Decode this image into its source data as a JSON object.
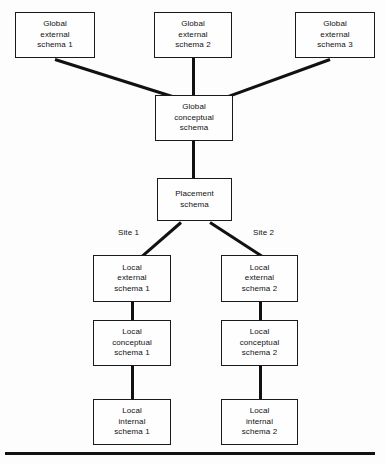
{
  "diagram": {
    "background_color": "#fdfdfd",
    "line_color": "#111111",
    "box_border_color": "#1a1a1a",
    "nodes": {
      "global_external_1": {
        "line1": "Global",
        "line2": "external",
        "line3": "schema 1"
      },
      "global_external_2": {
        "line1": "Global",
        "line2": "external",
        "line3": "schema 2"
      },
      "global_external_3": {
        "line1": "Global",
        "line2": "external",
        "line3": "schema 3"
      },
      "global_conceptual": {
        "line1": "Global",
        "line2": "conceptual",
        "line3": "schema"
      },
      "placement": {
        "line1": "Placement",
        "line2": "schema",
        "line3": ""
      },
      "local_external_1": {
        "line1": "Local",
        "line2": "external",
        "line3": "schema 1"
      },
      "local_external_2": {
        "line1": "Local",
        "line2": "external",
        "line3": "schema 2"
      },
      "local_conceptual_1": {
        "line1": "Local",
        "line2": "conceptual",
        "line3": "schema 1"
      },
      "local_conceptual_2": {
        "line1": "Local",
        "line2": "conceptual",
        "line3": "schema 2"
      },
      "local_internal_1": {
        "line1": "Local",
        "line2": "internal",
        "line3": "schema 1"
      },
      "local_internal_2": {
        "line1": "Local",
        "line2": "internal",
        "line3": "schema 2"
      }
    },
    "labels": {
      "site_1": "Site 1",
      "site_2": "Site 2"
    }
  }
}
